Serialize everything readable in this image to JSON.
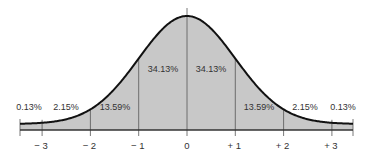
{
  "chart_data": {
    "type": "area",
    "title": "",
    "xlabel": "",
    "ylabel": "",
    "x_ticks": [
      "− 3",
      "− 2",
      "− 1",
      "0",
      "+ 1",
      "+ 2",
      "+ 3"
    ],
    "x_values": [
      -3,
      -2,
      -1,
      0,
      1,
      2,
      3
    ],
    "xlim": [
      -3.5,
      3.5
    ],
    "grid": false,
    "legend": null,
    "regions": [
      {
        "from": -3.5,
        "to": -3,
        "label": "0.13%",
        "value": 0.13
      },
      {
        "from": -3,
        "to": -2,
        "label": "2.15%",
        "value": 2.15
      },
      {
        "from": -2,
        "to": -1,
        "label": "13.59%",
        "value": 13.59
      },
      {
        "from": -1,
        "to": 0,
        "label": "34.13%",
        "value": 34.13
      },
      {
        "from": 0,
        "to": 1,
        "label": "34.13%",
        "value": 34.13
      },
      {
        "from": 1,
        "to": 2,
        "label": "13.59%",
        "value": 13.59
      },
      {
        "from": 2,
        "to": 3,
        "label": "2.15%",
        "value": 2.15
      },
      {
        "from": 3,
        "to": 3.5,
        "label": "0.13%",
        "value": 0.13
      }
    ],
    "colors": {
      "fill": "#c8c8c8",
      "curve": "#111111",
      "axis": "#333333",
      "divider": "#555555"
    }
  }
}
